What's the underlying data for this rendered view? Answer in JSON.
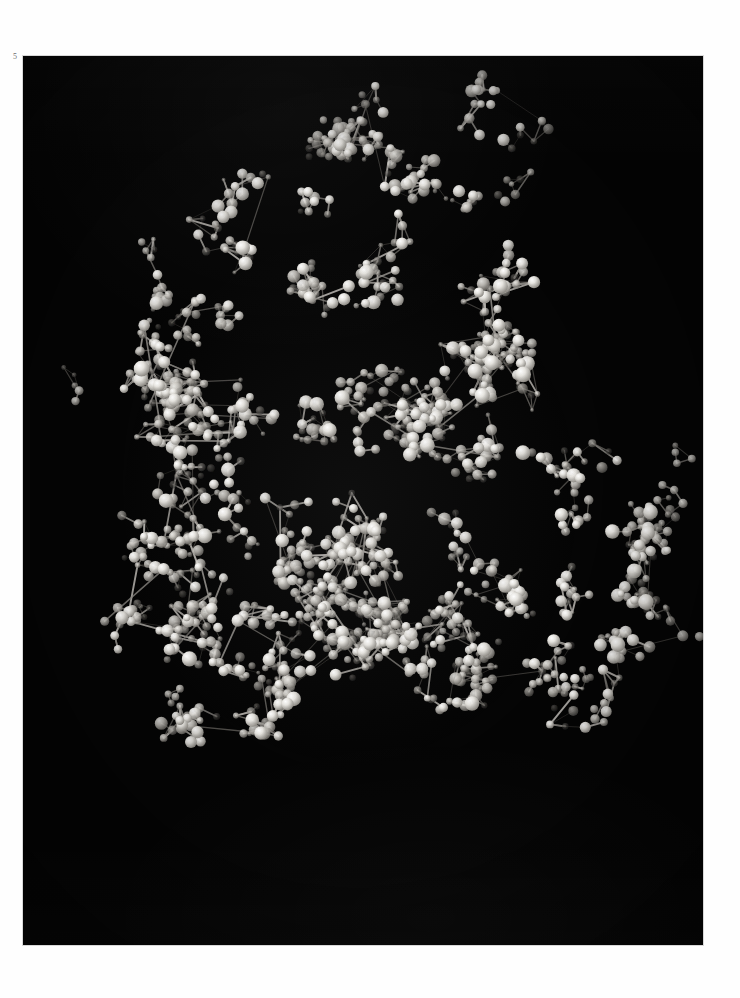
{
  "page": {
    "plate_number": "5",
    "background_color": "#ffffff",
    "plate_background_color": "#050505",
    "plate_border_color": "#d8d8d8"
  },
  "figure": {
    "kind": "photograph",
    "rendering": "black-and-white photograph of a physical ball-and-stick model photographed against a black background",
    "palette": {
      "background": "#050505",
      "bright_atom": "#f2f2f0",
      "light_atom": "#cfcdc8",
      "mid_atom": "#9a9792",
      "dark_atom": "#4a4845",
      "bond": "#8e8b85",
      "highlight": "#ffffff"
    },
    "atom_shades": [
      "#f2f2f0",
      "#dedcd7",
      "#c2bfb9",
      "#a3a09a",
      "#827f79",
      "#5e5b57",
      "#413f3c"
    ],
    "plate_bounds": {
      "x": 23,
      "y": 56,
      "width": 680,
      "height": 889
    },
    "cluster_bounds": {
      "x": 40,
      "y": 120,
      "width": 645,
      "height": 730
    },
    "atom_count_estimate": 900,
    "bond_count_estimate": 1000
  },
  "chart_data": {
    "type": "scatter",
    "title": "",
    "xlabel": "",
    "ylabel": "",
    "grid": false,
    "legend": null,
    "cluster_seed": 20250511,
    "atom_size_range": [
      2.2,
      7.0
    ],
    "bond_width_range": [
      0.8,
      2.0
    ]
  }
}
